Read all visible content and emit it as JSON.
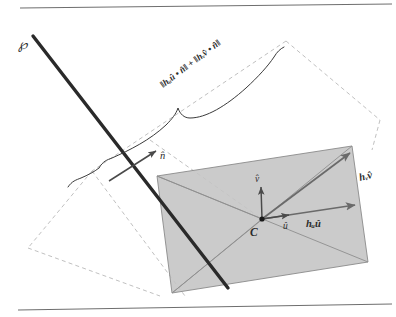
{
  "figure": {
    "labels": {
      "plane": "℘",
      "normal": "n̂",
      "center": "C",
      "unit_u": "û",
      "unit_v": "v̂",
      "extent_u": "hᵤû",
      "extent_v": "hᵥv̂",
      "extent_u_parts": {
        "base": "h",
        "sub": "û",
        "vec": "û"
      },
      "extent_v_parts": {
        "base": "h",
        "sub": "v̂",
        "vec": "v̂"
      },
      "brace_expression": "‖hᵤû • n̂‖ + ‖hᵥv̂ • n̂‖",
      "brace_expression_parts": {
        "term1": "‖hᵤû • n̂‖",
        "plus": "+",
        "term2": "‖hᵥv̂ • n̂‖"
      }
    },
    "colors": {
      "box_fill": "#c4c4c4",
      "box_stroke": "#8a8a8a",
      "plane_line": "#2a2a2a",
      "dashed_guide": "#b9b9b9",
      "vector_arrow": "#6a6a6a",
      "text": "#2b2b2b",
      "rule": "#6e6e6e",
      "background": "#ffffff"
    },
    "geometry": {
      "box_corners": [
        {
          "name": "top-left",
          "x": 157,
          "y": 176
        },
        {
          "name": "top-right",
          "x": 352,
          "y": 146
        },
        {
          "name": "bottom-right",
          "x": 368,
          "y": 262
        },
        {
          "name": "bottom-left",
          "x": 172,
          "y": 293
        }
      ],
      "center": {
        "x": 262,
        "y": 219
      },
      "plane_ray": {
        "x1": 33,
        "y1": 36,
        "x2": 228,
        "y2": 288
      },
      "normal_arrow": {
        "x1": 109,
        "y1": 180,
        "x2": 157,
        "y2": 151
      }
    }
  }
}
